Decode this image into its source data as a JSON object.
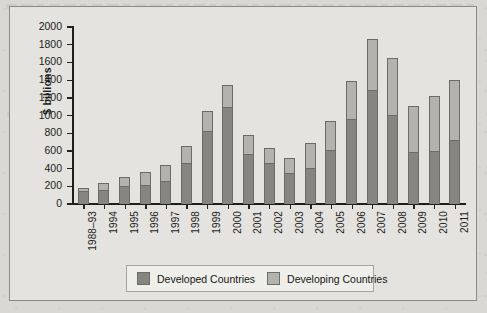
{
  "chart_data": {
    "type": "bar",
    "subtype": "stacked-bar",
    "title": "",
    "xlabel": "",
    "ylabel": "$ billions",
    "ylim": [
      0,
      2000
    ],
    "ytick_step": 200,
    "yticks": [
      2000,
      1800,
      1600,
      1400,
      1200,
      1000,
      800,
      600,
      400,
      200,
      0
    ],
    "grid": false,
    "legend_position": "bottom",
    "categories": [
      "1988–93",
      "1994",
      "1995",
      "1996",
      "1997",
      "1998",
      "1999",
      "2000",
      "2001",
      "2002",
      "2003",
      "2004",
      "2005",
      "2006",
      "2007",
      "2008",
      "2009",
      "2010",
      "2011"
    ],
    "series": [
      {
        "name": "Developed Countries",
        "color": "#87857f",
        "values": [
          150,
          155,
          200,
          220,
          265,
          460,
          820,
          1100,
          560,
          465,
          350,
          410,
          610,
          965,
          1290,
          1005,
          585,
          600,
          720
        ]
      },
      {
        "name": "Developing Countries",
        "color": "#b3b2ad",
        "values": [
          30,
          85,
          110,
          140,
          180,
          195,
          230,
          250,
          220,
          165,
          165,
          275,
          330,
          420,
          570,
          645,
          525,
          615,
          685
        ]
      }
    ],
    "totals": [
      180,
      240,
      310,
      360,
      445,
      655,
      1050,
      1350,
      780,
      630,
      515,
      685,
      940,
      1385,
      1860,
      1650,
      1110,
      1215,
      1405
    ]
  },
  "legend": {
    "entries": [
      {
        "label": "Developed Countries",
        "swatch": "developed-swatch"
      },
      {
        "label": "Developing Countries",
        "swatch": "developing-swatch"
      }
    ]
  },
  "colors": {
    "developed": "#87857f",
    "developing": "#b3b2ad",
    "axis": "#1e1e1c",
    "plot_background": "#e4e3df",
    "page_background": "#d9d8d5"
  }
}
